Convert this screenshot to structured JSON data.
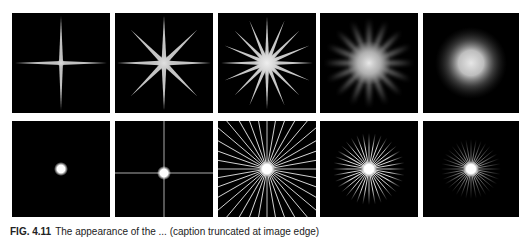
{
  "figure": {
    "caption_label": "FIG. 4.11",
    "caption_text": "The appearance of the ... (caption truncated at image edge)",
    "rows": [
      {
        "panels": [
          {
            "id": 1,
            "type": "star",
            "points": 4,
            "blur": 0,
            "core": 3,
            "color": "#c8c8c8"
          },
          {
            "id": 2,
            "type": "star",
            "points": 8,
            "blur": 0,
            "core": 6,
            "color": "#c8c8c8"
          },
          {
            "id": 3,
            "type": "star",
            "points": 16,
            "blur": 0,
            "core": 10,
            "color": "#cfcfcf"
          },
          {
            "id": 4,
            "type": "star",
            "points": 16,
            "blur": 3,
            "core": 14,
            "color": "#9a9a9a"
          },
          {
            "id": 5,
            "type": "glow",
            "points": 0,
            "blur": 0,
            "core": 16,
            "color": "#d0d0d0"
          }
        ]
      },
      {
        "panels": [
          {
            "id": 6,
            "type": "dot",
            "spokes": 0,
            "core": 5,
            "color": "#ffffff"
          },
          {
            "id": 7,
            "type": "cross-dot",
            "spokes": 4,
            "core": 5,
            "color": "#ffffff"
          },
          {
            "id": 8,
            "type": "radial",
            "spokes": 36,
            "core": 6,
            "length": 1.0,
            "color": "#dddddd"
          },
          {
            "id": 9,
            "type": "radial",
            "spokes": 36,
            "core": 6,
            "length": 0.7,
            "color": "#dddddd"
          },
          {
            "id": 10,
            "type": "radial-fade",
            "spokes": 36,
            "core": 6,
            "length": 0.55,
            "color": "#cccccc"
          }
        ]
      }
    ]
  }
}
